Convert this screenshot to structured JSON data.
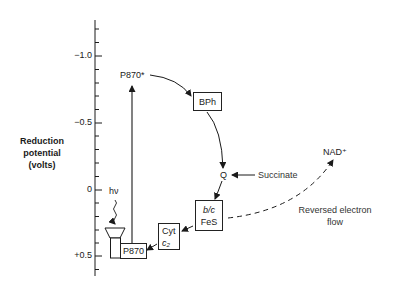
{
  "axis": {
    "title_lines": [
      "Reduction",
      "potential",
      "(volts)"
    ],
    "ticks": [
      "−1.0",
      "−0.5",
      "0",
      "+0.5"
    ],
    "range": [
      -1.3,
      0.65
    ],
    "minor_tick_step": 0.1
  },
  "components": {
    "p870_excited": "P870*",
    "p870": "P870",
    "bph": "BPh",
    "q": "Q",
    "succinate": "Succinate",
    "bc_top": "b/c",
    "bc_bottom": "FeS",
    "cyt_top": "Cyt",
    "cyt_bottom": "c₂",
    "nad": "NAD⁺",
    "light": "hν"
  },
  "annotations": {
    "reversed_line1": "Reversed electron",
    "reversed_line2": "flow"
  },
  "colors": {
    "line": "#1a1a1a",
    "background": "#ffffff"
  }
}
